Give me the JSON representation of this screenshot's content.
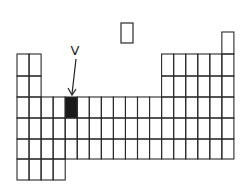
{
  "diagram": {
    "type": "periodic-table-outline",
    "label": "V",
    "highlight_color": "#1a1a1a",
    "line_color": "#2a2a2a",
    "background": "#ffffff",
    "grid": {
      "origin_x": 17,
      "col_width": 12.05,
      "row_tops": [
        54,
        76,
        97,
        118,
        139,
        159,
        180
      ],
      "period1_top": 32
    },
    "highlighted_cell": {
      "period": 3,
      "group": 5
    },
    "isolated_box": {
      "x": 121,
      "y": 23,
      "w": 12,
      "h": 20
    }
  }
}
